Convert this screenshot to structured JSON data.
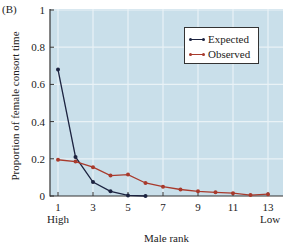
{
  "panel_label": "(B)",
  "chart_data": {
    "type": "line",
    "title": "",
    "xlabel": "Male rank",
    "ylabel": "Proportion of female consort time",
    "x_end_labels": {
      "left": "High",
      "right": "Low"
    },
    "xlim": [
      0.5,
      13.8
    ],
    "ylim": [
      0,
      1
    ],
    "xticks": [
      1,
      3,
      5,
      7,
      9,
      11,
      13
    ],
    "yticks": [
      0,
      0.2,
      0.4,
      0.6,
      0.8,
      1
    ],
    "ytick_labels": [
      "0",
      "0.2",
      "0.4",
      "0.6",
      "0.8",
      "1"
    ],
    "grid": true,
    "legend_position": "upper right",
    "series": [
      {
        "name": "Expected",
        "color": "#1c2340",
        "x": [
          1,
          2,
          3,
          4,
          5,
          6
        ],
        "values": [
          0.68,
          0.21,
          0.075,
          0.025,
          0.003,
          0.0
        ]
      },
      {
        "name": "Observed",
        "color": "#a83a2c",
        "x": [
          1,
          2,
          3,
          4,
          5,
          6,
          7,
          8,
          9,
          10,
          11,
          12,
          13
        ],
        "values": [
          0.195,
          0.185,
          0.155,
          0.11,
          0.115,
          0.07,
          0.05,
          0.035,
          0.025,
          0.02,
          0.015,
          0.005,
          0.01
        ]
      }
    ]
  },
  "colors": {
    "plot_background": "#c9dfea",
    "grid": "#e9f2f6",
    "axis": "#333333"
  }
}
